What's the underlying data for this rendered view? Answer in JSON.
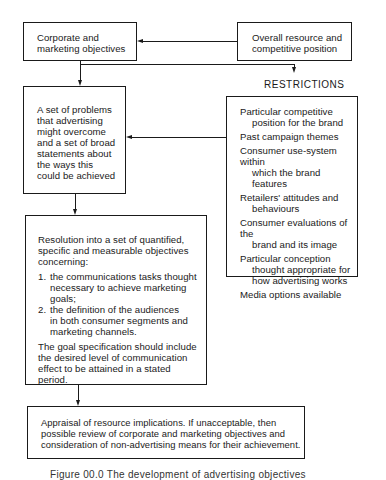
{
  "diagram": {
    "type": "flowchart",
    "nodes": {
      "corporate": {
        "lines": [
          "Corporate and",
          "marketing objectives"
        ]
      },
      "overall": {
        "lines": [
          "Overall resource and",
          "competitive position"
        ]
      },
      "restrictions_label": "RESTRICTIONS",
      "problems": {
        "lines": [
          "A set of problems",
          "that advertising",
          "might overcome",
          "and a set of broad",
          "statements about",
          "the ways this",
          "could be achieved"
        ]
      },
      "restrictions": {
        "items": [
          {
            "first": "Particular competitive",
            "cont": "position for the brand"
          },
          {
            "first": "Past campaign themes",
            "cont": ""
          },
          {
            "first": "Consumer use-system within",
            "cont": "which the brand features"
          },
          {
            "first": "Retailers' attitudes and",
            "cont": "behaviours"
          },
          {
            "first": "Consumer evaluations of the",
            "cont": "brand and its image"
          },
          {
            "first": "Particular conception",
            "cont": "thought appropriate for",
            "cont2": "how advertising works"
          },
          {
            "first": "Media options available",
            "cont": ""
          }
        ]
      },
      "resolution": {
        "intro_lines": [
          "Resolution into a set of quantified,",
          "specific and measurable objectives",
          "concerning:"
        ],
        "list": [
          {
            "num": "1.",
            "lines": [
              "the communications tasks thought",
              "necessary to achieve marketing",
              "goals;"
            ]
          },
          {
            "num": "2.",
            "lines": [
              "the definition of the audiences",
              "in both consumer segments and",
              "marketing channels."
            ]
          }
        ],
        "outro_lines": [
          "The goal specification should include",
          "the desired level of communication",
          "effect to be attained in a stated",
          "period."
        ]
      },
      "appraisal": {
        "lines": [
          "Appraisal of resource implications. If unacceptable, then",
          "possible review of corporate and marketing objectives and",
          "consideration of non-advertising means for their achievement."
        ]
      }
    },
    "edges": [
      {
        "from": "overall",
        "to": "corporate"
      },
      {
        "from": "corporate",
        "to": "problems"
      },
      {
        "from": "corporate",
        "to": "restrictions"
      },
      {
        "from": "restrictions",
        "to": "problems"
      },
      {
        "from": "problems",
        "to": "resolution"
      },
      {
        "from": "resolution",
        "to": "appraisal"
      }
    ],
    "caption": "Figure 00.0  The development of advertising objectives"
  }
}
